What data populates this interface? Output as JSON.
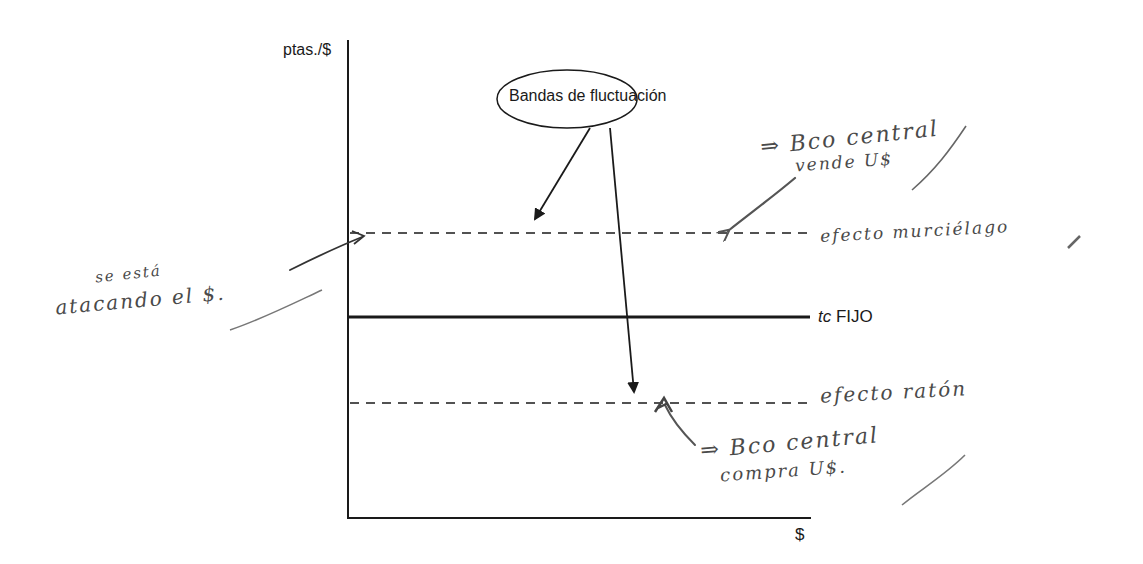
{
  "diagram": {
    "axes": {
      "y_label": "ptas./$",
      "x_label": "$"
    },
    "lines": {
      "fixed_rate": {
        "prefix": "tc",
        "label": "FIJO"
      },
      "upper_band": {
        "style": "dashed"
      },
      "lower_band": {
        "style": "dashed"
      }
    },
    "callout": {
      "label": "Bandas de fluctuación"
    },
    "handwritten_annotations": {
      "upper_right_line1": "⇒ Bco central",
      "upper_right_line2": "vende U$",
      "upper_band_note": "efecto murciélago",
      "left_note_line1": "se está",
      "left_note_line2": "atacando el $.",
      "lower_band_note": "efecto ratón",
      "lower_right_line1": "⇒ Bco central",
      "lower_right_line2": "compra U$."
    },
    "colors": {
      "ink": "#1a1a1a",
      "pencil": "#4a4a4a",
      "background": "#ffffff"
    }
  }
}
